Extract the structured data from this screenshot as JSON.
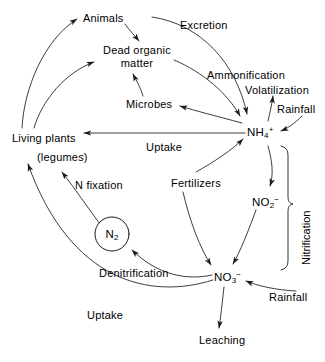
{
  "diagram": {
    "type": "cycle-flow-diagram",
    "background_color": "#ffffff",
    "stroke_color": "#1a1a1a",
    "text_color": "#000000",
    "width": 325,
    "height": 362
  },
  "nodes": {
    "animals": {
      "label": "Animals",
      "x": 83,
      "y": 12
    },
    "dead_organic_matter": {
      "label_line1": "Dead  organic",
      "label_line2": "matter",
      "x": 103,
      "y": 44
    },
    "microbes": {
      "label": "Microbes",
      "x": 126,
      "y": 98
    },
    "living_plants": {
      "label": "Living plants",
      "x": 12,
      "y": 132
    },
    "legumes": {
      "label": "(legumes)",
      "x": 37,
      "y": 151
    },
    "n2": {
      "label_main": "N",
      "label_sub": "2",
      "cx": 112,
      "cy": 234,
      "r": 17
    },
    "nh4": {
      "label_main": "NH",
      "label_sub": "4",
      "label_sup": "+",
      "x": 247,
      "y": 124
    },
    "no2": {
      "label_main": "NO",
      "label_sub": "2",
      "label_sup": "−",
      "x": 252,
      "y": 194
    },
    "no3": {
      "label_main": "NO",
      "label_sub": "3",
      "label_sup": "−",
      "x": 214,
      "y": 269
    }
  },
  "edge_labels": {
    "excretion": {
      "label": "Excretion",
      "x": 180,
      "y": 19
    },
    "ammonification": {
      "label": "Ammonification",
      "x": 207,
      "y": 69
    },
    "volatilization": {
      "label": "Volatilization",
      "x": 245,
      "y": 84
    },
    "rainfall_top": {
      "label": "Rainfall",
      "x": 277,
      "y": 103
    },
    "uptake_top": {
      "label": "Uptake",
      "x": 146,
      "y": 141
    },
    "n_fixation": {
      "label": "N fixation",
      "x": 75,
      "y": 179
    },
    "fertilizers": {
      "label": "Fertilizers",
      "x": 171,
      "y": 177
    },
    "nitrification": {
      "label": "Nitrification",
      "x": 300,
      "y": 265
    },
    "denitrification": {
      "label": "Denitrification",
      "x": 99,
      "y": 267
    },
    "rainfall_bottom": {
      "label": "Rainfall",
      "x": 269,
      "y": 291
    },
    "uptake_bottom": {
      "label": "Uptake",
      "x": 87,
      "y": 309
    },
    "leaching": {
      "label": "Leaching",
      "x": 199,
      "y": 334
    }
  },
  "flows": [
    {
      "name": "living-plants-to-animals",
      "from": "living_plants",
      "to": "animals",
      "label": ""
    },
    {
      "name": "living-plants-to-dead-organic-matter",
      "from": "living_plants",
      "to": "dead_organic_matter",
      "label": ""
    },
    {
      "name": "animals-to-dead-organic-matter",
      "from": "animals",
      "to": "dead_organic_matter",
      "label": ""
    },
    {
      "name": "animals-to-nh4-excretion",
      "from": "animals",
      "to": "nh4",
      "label": "Excretion"
    },
    {
      "name": "dead-organic-matter-to-nh4-ammonification",
      "from": "dead_organic_matter",
      "to": "nh4",
      "label": "Ammonification"
    },
    {
      "name": "microbes-to-dead-organic-matter",
      "from": "microbes",
      "to": "dead_organic_matter",
      "label": ""
    },
    {
      "name": "nh4-to-microbes",
      "from": "nh4",
      "to": "microbes",
      "label": ""
    },
    {
      "name": "nh4-to-volatilization",
      "from": "nh4",
      "to": "volatilization",
      "label": "Volatilization"
    },
    {
      "name": "rainfall-to-nh4",
      "from": "rainfall_top",
      "to": "nh4",
      "label": "Rainfall"
    },
    {
      "name": "nh4-to-living-plants-uptake",
      "from": "nh4",
      "to": "living_plants",
      "label": "Uptake"
    },
    {
      "name": "fertilizers-to-nh4",
      "from": "fertilizers",
      "to": "nh4",
      "label": "Fertilizers"
    },
    {
      "name": "fertilizers-to-no3",
      "from": "fertilizers",
      "to": "no3",
      "label": "Fertilizers"
    },
    {
      "name": "nh4-to-no2-nitrification",
      "from": "nh4",
      "to": "no2",
      "label": "Nitrification"
    },
    {
      "name": "no2-to-no3-nitrification",
      "from": "no2",
      "to": "no3",
      "label": "Nitrification"
    },
    {
      "name": "no3-to-n2-denitrification",
      "from": "no3",
      "to": "n2",
      "label": "Denitrification"
    },
    {
      "name": "n2-to-living-plants-n-fixation",
      "from": "n2",
      "to": "legumes",
      "label": "N fixation"
    },
    {
      "name": "no3-to-living-plants-uptake",
      "from": "no3",
      "to": "living_plants",
      "label": "Uptake"
    },
    {
      "name": "rainfall-to-no3",
      "from": "rainfall_bottom",
      "to": "no3",
      "label": "Rainfall"
    },
    {
      "name": "no3-to-leaching",
      "from": "no3",
      "to": "leaching",
      "label": "Leaching"
    }
  ]
}
